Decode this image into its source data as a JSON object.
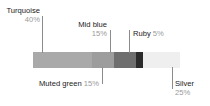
{
  "chart_data": {
    "type": "bar",
    "title": "",
    "subtitle": "",
    "xlabel": "",
    "ylabel": "",
    "orientation": "horizontal-stacked",
    "grid": false,
    "legend_position": "callouts",
    "units": "percent",
    "total": 100,
    "categories": [
      "Turquoise",
      "Muted green",
      "Mid blue",
      "Ruby",
      "Silver"
    ],
    "values": [
      40,
      15,
      15,
      5,
      25
    ],
    "value_labels": [
      "40%",
      "15%",
      "15%",
      "5%",
      "25%"
    ],
    "segment_colors": [
      "#a9a9a9",
      "#9d9d9d",
      "#6e6e6e",
      "#2b2b2b",
      "#efefef"
    ],
    "series": [
      {
        "name": "Colour mix",
        "values": [
          40,
          15,
          15,
          5,
          25
        ]
      }
    ]
  },
  "chart": {
    "bar": {
      "segments": [
        {
          "name": "Turquoise",
          "percent_label": "40%",
          "color": "#a9a9a9"
        },
        {
          "name": "Muted green",
          "percent_label": "15%",
          "color": "#9d9d9d"
        },
        {
          "name": "Mid blue",
          "percent_label": "15%",
          "color": "#6e6e6e"
        },
        {
          "name": "Ruby",
          "percent_label": "5%",
          "color": "#2b2b2b"
        },
        {
          "name": "Silver",
          "percent_label": "25%",
          "color": "#efefef"
        }
      ]
    },
    "callouts": {
      "turquoise": {
        "name": "Turquoise",
        "percent_label": "40%"
      },
      "mid_blue": {
        "name": "Mid blue",
        "percent_label": "15%"
      },
      "ruby": {
        "name": "Ruby",
        "percent_label": "5%"
      },
      "muted_green": {
        "name": "Muted green",
        "percent_label": "15%"
      },
      "silver": {
        "name": "Silver",
        "percent_label": "25%"
      }
    },
    "colors": {
      "leader_line": "#8c8c8c",
      "label_text": "#1a1a1a",
      "percent_text": "#9a9a9a",
      "background": "#ffffff"
    }
  }
}
